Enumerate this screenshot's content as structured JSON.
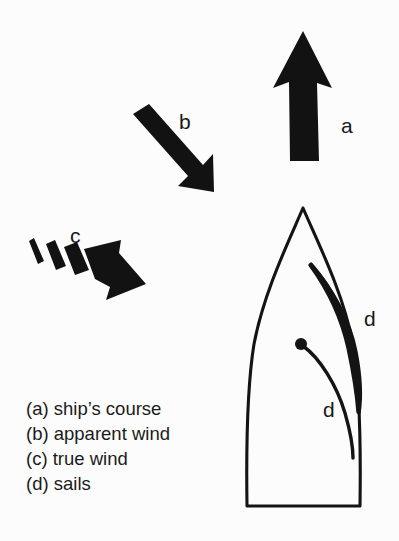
{
  "figure": {
    "background_color": "#fcfcfc",
    "ink_color": "#141414",
    "width": 399,
    "height": 541
  },
  "arrow_labels": {
    "a": "a",
    "b": "b",
    "c": "c",
    "d_jib": "d",
    "d_main": "d"
  },
  "arrows": [
    {
      "key": "a",
      "label": "a",
      "meaning": "ship's course",
      "style": "solid tapered arrow",
      "direction": "up",
      "angle_deg": 0
    },
    {
      "key": "b",
      "label": "b",
      "meaning": "apparent wind",
      "style": "solid block arrow",
      "direction": "down-right",
      "angle_deg": 135
    },
    {
      "key": "c",
      "label": "c",
      "meaning": "true wind",
      "style": "dashed-tail block arrow",
      "direction": "down-right",
      "angle_deg": 115,
      "tail_segments": 3
    }
  ],
  "ship": {
    "name": "sailboat",
    "view": "plan view from above",
    "parts": [
      {
        "name": "hull",
        "label": ""
      },
      {
        "name": "jib-sail",
        "label": "d"
      },
      {
        "name": "mainsail",
        "label": "d"
      },
      {
        "name": "mast",
        "label": ""
      }
    ]
  },
  "legend": {
    "items": [
      {
        "key": "a",
        "text": "(a) ship’s course"
      },
      {
        "key": "b",
        "text": "(b) apparent wind"
      },
      {
        "key": "c",
        "text": "(c) true wind"
      },
      {
        "key": "d",
        "text": "(d) sails"
      }
    ]
  }
}
